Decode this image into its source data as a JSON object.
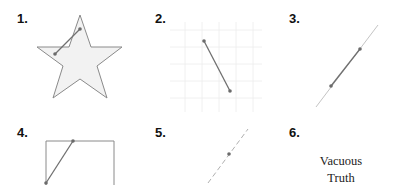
{
  "figure": {
    "panels": [
      {
        "label": "1.",
        "shape": "star",
        "description": "segment with both endpoints inside star but crossing outside"
      },
      {
        "label": "2.",
        "shape": "grid-plane",
        "description": "segment in plane"
      },
      {
        "label": "3.",
        "shape": "line",
        "description": "segment on line"
      },
      {
        "label": "4.",
        "shape": "rectangle",
        "description": "segment inside rectangle"
      },
      {
        "label": "5.",
        "shape": "dashed-line-point",
        "description": "single point"
      },
      {
        "label": "6.",
        "shape": "text",
        "description": "empty set",
        "text_line1": "Vacuous",
        "text_line2": "Truth"
      }
    ]
  },
  "colors": {
    "outline": "#8a8a8a",
    "star_fill": "#f2f2f2",
    "grid": "#ececec",
    "segment": "#707070",
    "point": "#6b6b6b",
    "label": "#111111"
  }
}
